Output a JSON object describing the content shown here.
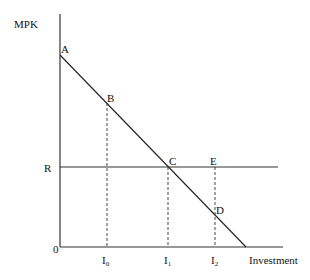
{
  "diagram": {
    "y_axis_label": "MPK",
    "x_axis_label": "Investment",
    "origin_label": "0",
    "rate_label": "R",
    "points": {
      "A": "A",
      "B": "B",
      "C": "C",
      "D": "D",
      "E": "E"
    },
    "x_ticks": [
      {
        "base": "I",
        "sub": "0"
      },
      {
        "base": "I",
        "sub": "1"
      },
      {
        "base": "I",
        "sub": "2"
      }
    ],
    "colors": {
      "line": "#222222",
      "background": "#ffffff"
    }
  }
}
